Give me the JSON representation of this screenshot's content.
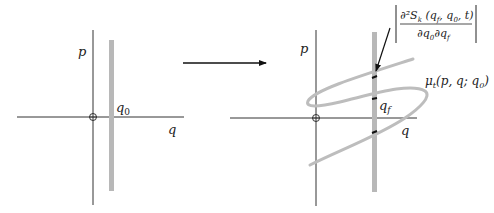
{
  "left_panel": {
    "axis_p_label": "p",
    "axis_q_label": "q",
    "band_label": "q",
    "band_label_sub": "0"
  },
  "arrow": {
    "direction": "right"
  },
  "right_panel": {
    "axis_p_label": "p",
    "axis_q_label": "q",
    "band_label": "q",
    "band_label_sub": "f",
    "manifold_label": "μ",
    "manifold_label_sub": "t",
    "manifold_label_args": "(p, q; q",
    "manifold_label_args_sub": "0",
    "manifold_label_close": ")",
    "formula": {
      "numerator_main": "∂²S",
      "numerator_sub": "k",
      "numerator_args_open": " (q",
      "numerator_args_sub1": "f",
      "numerator_args_mid": ", q",
      "numerator_args_sub2": "0",
      "numerator_args_close": ", t)",
      "denominator_a": "∂q",
      "denominator_a_sub": "0",
      "denominator_b": "∂q",
      "denominator_b_sub": "f"
    }
  },
  "colors": {
    "axis": "#333333",
    "band": "#b8b8b8",
    "curve": "#bdbdbd",
    "arrow": "#111111",
    "intersection": "#111111"
  }
}
